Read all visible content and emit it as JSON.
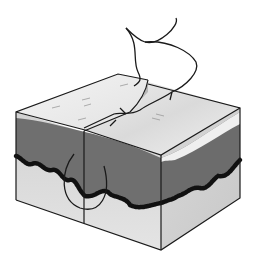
{
  "figure": {
    "description": "Illustration of a simple interrupted suture placed through an incision in a block of skin showing epidermis, dermis and subcutaneous layers",
    "colors": {
      "background": "#ffffff",
      "surface_top": "#ececec",
      "surface_shade": "#d6d6d6",
      "side_face": "#dcdcdc",
      "dermis": "#6e6e6e",
      "basal_layer": "#111111",
      "outline": "#1a1a1a",
      "suture": "#1a1a1a"
    },
    "labels": []
  }
}
